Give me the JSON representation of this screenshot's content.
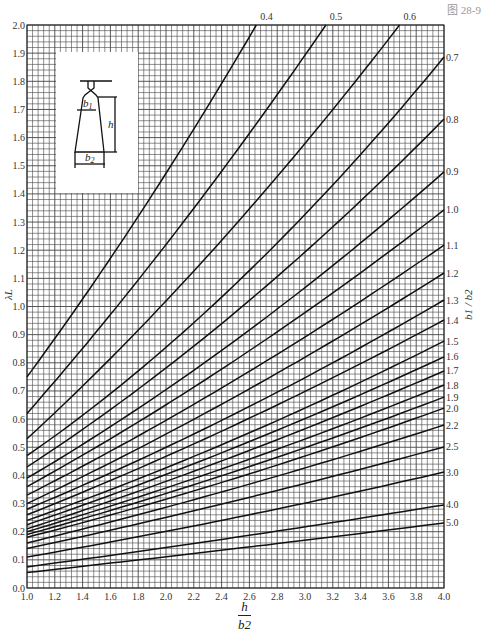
{
  "figure": {
    "number_label": "图 28-9",
    "x_axis_label_numerator": "h",
    "x_axis_label_denominator": "b2",
    "y_axis_label": "λL",
    "right_axis_label": "b1 / b2",
    "inset": {
      "labels": [
        "b1",
        "h",
        "b2"
      ]
    }
  },
  "chart_data": {
    "type": "line",
    "title": "",
    "xlabel": "h / b2",
    "ylabel": "λL",
    "right_label": "b1 / b2",
    "xlim": [
      1.0,
      4.0
    ],
    "ylim": [
      0.0,
      2.0
    ],
    "grid": true,
    "x_ticks": [
      "1.0",
      "1.2",
      "1.4",
      "1.6",
      "1.8",
      "2.0",
      "2.2",
      "2.4",
      "2.6",
      "2.8",
      "3.0",
      "3.2",
      "3.4",
      "3.6",
      "3.8",
      "4.0"
    ],
    "y_ticks": [
      "0.0",
      "0.1",
      "0.2",
      "0.3",
      "0.4",
      "0.5",
      "0.6",
      "0.7",
      "0.8",
      "0.9",
      "1.0",
      "1.1",
      "1.2",
      "1.3",
      "1.4",
      "1.5",
      "1.6",
      "1.7",
      "1.8",
      "1.9",
      "2.0"
    ],
    "series": [
      {
        "name": "0.4",
        "x": [
          1.0,
          1.8,
          2.65
        ],
        "y": [
          0.75,
          1.32,
          2.0
        ]
      },
      {
        "name": "0.5",
        "x": [
          1.0,
          2.0,
          3.15
        ],
        "y": [
          0.62,
          1.22,
          2.0
        ]
      },
      {
        "name": "0.6",
        "x": [
          1.0,
          2.3,
          3.68
        ],
        "y": [
          0.53,
          1.18,
          2.0
        ]
      },
      {
        "name": "0.7",
        "x": [
          1.0,
          2.5,
          4.0
        ],
        "y": [
          0.47,
          1.08,
          1.886
        ]
      },
      {
        "name": "0.8",
        "x": [
          1.0,
          2.5,
          4.0
        ],
        "y": [
          0.43,
          0.98,
          1.666
        ]
      },
      {
        "name": "0.9",
        "x": [
          1.0,
          2.5,
          4.0
        ],
        "y": [
          0.39,
          0.88,
          1.478
        ]
      },
      {
        "name": "1.0",
        "x": [
          1.0,
          2.5,
          4.0
        ],
        "y": [
          0.36,
          0.81,
          1.343
        ]
      },
      {
        "name": "1.1",
        "x": [
          1.0,
          2.5,
          4.0
        ],
        "y": [
          0.33,
          0.74,
          1.218
        ]
      },
      {
        "name": "1.2",
        "x": [
          1.0,
          2.5,
          4.0
        ],
        "y": [
          0.3,
          0.68,
          1.119
        ]
      },
      {
        "name": "1.3",
        "x": [
          1.0,
          2.5,
          4.0
        ],
        "y": [
          0.28,
          0.62,
          1.023
        ]
      },
      {
        "name": "1.4",
        "x": [
          1.0,
          2.5,
          4.0
        ],
        "y": [
          0.26,
          0.58,
          0.952
        ]
      },
      {
        "name": "1.5",
        "x": [
          1.0,
          2.5,
          4.0
        ],
        "y": [
          0.24,
          0.53,
          0.877
        ]
      },
      {
        "name": "1.6",
        "x": [
          1.0,
          2.5,
          4.0
        ],
        "y": [
          0.225,
          0.5,
          0.821
        ]
      },
      {
        "name": "1.7",
        "x": [
          1.0,
          2.5,
          4.0
        ],
        "y": [
          0.21,
          0.47,
          0.771
        ]
      },
      {
        "name": "1.8",
        "x": [
          1.0,
          2.5,
          4.0
        ],
        "y": [
          0.2,
          0.44,
          0.721
        ]
      },
      {
        "name": "1.9",
        "x": [
          1.0,
          2.5,
          4.0
        ],
        "y": [
          0.19,
          0.415,
          0.678
        ]
      },
      {
        "name": "2.0",
        "x": [
          1.0,
          2.5,
          4.0
        ],
        "y": [
          0.18,
          0.39,
          0.639
        ]
      },
      {
        "name": "2.2",
        "x": [
          1.0,
          2.5,
          4.0
        ],
        "y": [
          0.16,
          0.355,
          0.579
        ]
      },
      {
        "name": "2.5",
        "x": [
          1.0,
          2.5,
          4.0
        ],
        "y": [
          0.14,
          0.31,
          0.501
        ]
      },
      {
        "name": "3.0",
        "x": [
          1.0,
          2.5,
          4.0
        ],
        "y": [
          0.11,
          0.25,
          0.412
        ]
      },
      {
        "name": "4.0",
        "x": [
          1.0,
          2.5,
          4.0
        ],
        "y": [
          0.075,
          0.18,
          0.295
        ]
      },
      {
        "name": "5.0",
        "x": [
          1.0,
          2.5,
          4.0
        ],
        "y": [
          0.055,
          0.14,
          0.231
        ]
      }
    ]
  }
}
